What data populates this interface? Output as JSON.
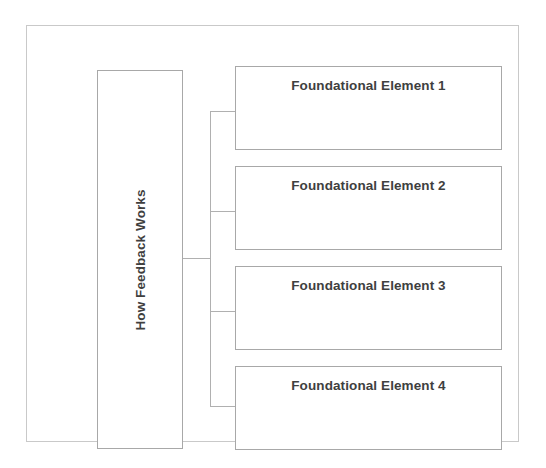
{
  "diagram": {
    "type": "hierarchy-tree",
    "root": {
      "label": "How Feedback Works",
      "orientation": "vertical-text"
    },
    "children": [
      {
        "label": "Foundational Element 1"
      },
      {
        "label": "Foundational Element 2"
      },
      {
        "label": "Foundational Element 3"
      },
      {
        "label": "Foundational Element 4"
      }
    ],
    "colors": {
      "background": "#ffffff",
      "frame_border": "#c9c9c9",
      "box_border": "#a8a8a8",
      "connector": "#b0b0b0",
      "text": "#3f3f3f"
    }
  }
}
